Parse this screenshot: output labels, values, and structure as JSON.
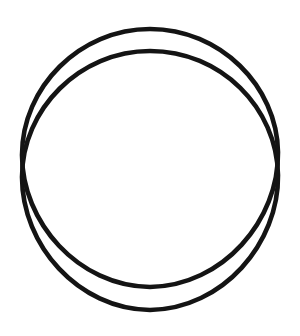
{
  "canvas": {
    "width": 300,
    "height": 336,
    "background_color": "#ffffff",
    "title": "",
    "description": "Line drawing of two overlapping circular outlines"
  },
  "drawing": {
    "kind": "line-drawing",
    "fill": "none",
    "stroke_color": "#141414",
    "stroke_width": 4.6,
    "shapes": [
      {
        "name": "upper-circle",
        "type": "ellipse-outline",
        "center_x": 150,
        "center_y": 158,
        "radius_x": 128,
        "radius_y": 129,
        "bounds": {
          "left": 22,
          "top": 29,
          "right": 278,
          "bottom": 287
        },
        "path": "M 150 29 C 220 29 277 86 278 152 C 279 220 223 286 150 287 C 78 286 22 222 22 155 C 22 87 80 29 150 29 Z"
      },
      {
        "name": "lower-circle",
        "type": "ellipse-outline",
        "center_x": 150,
        "center_y": 180,
        "radius_x": 128,
        "radius_y": 130,
        "bounds": {
          "left": 22,
          "top": 51,
          "right": 278,
          "bottom": 310
        },
        "path": "M 150 51 C 221 51 277 108 278 175 C 279 243 223 309 150 310 C 78 309 22 245 22 177 C 22 109 80 51 150 51 Z"
      }
    ]
  },
  "chart_data": {
    "type": "scatter",
    "title": "",
    "xlabel": "",
    "ylabel": "",
    "series": [],
    "grid": false
  }
}
